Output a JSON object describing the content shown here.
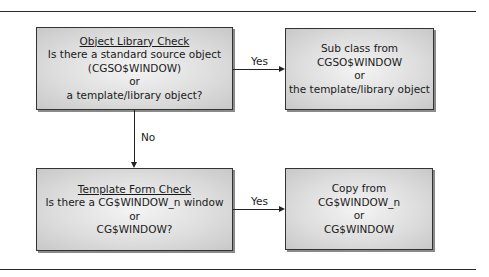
{
  "diagram": {
    "nodes": {
      "object_library_check": {
        "title": "Object Library Check",
        "lines": [
          "Is there a standard source object",
          "(CGSO$WINDOW)",
          "or",
          "a template/library object?"
        ]
      },
      "sub_class": {
        "lines": [
          "Sub class from",
          "CGSO$WINDOW",
          "or",
          "the template/library object"
        ]
      },
      "template_form_check": {
        "title": "Template Form Check",
        "lines": [
          "Is there a CG$WINDOW_n window",
          "or",
          "CG$WINDOW?"
        ]
      },
      "copy_from": {
        "lines": [
          "Copy from",
          "CG$WINDOW_n",
          "or",
          "CG$WINDOW"
        ]
      }
    },
    "edges": {
      "check1_yes": "Yes",
      "check1_no": "No",
      "check2_yes": "Yes"
    },
    "colors": {
      "box_fill": "#dcdcdc",
      "box_border": "#333333",
      "line": "#222222"
    }
  }
}
